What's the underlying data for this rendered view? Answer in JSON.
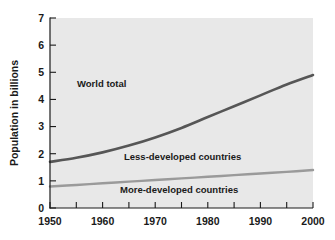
{
  "chart_data": {
    "type": "line",
    "title": "",
    "xlabel": "",
    "ylabel": "Population in billions",
    "xlim": [
      1950,
      2000
    ],
    "ylim": [
      0,
      7
    ],
    "grid": false,
    "legend_position": "inline-annotations",
    "x_ticks": [
      1950,
      1960,
      1970,
      1980,
      1990,
      2000
    ],
    "x_minor_ticks": [
      1955,
      1965,
      1975,
      1985,
      1995
    ],
    "y_ticks": [
      0,
      1,
      2,
      3,
      4,
      5,
      6,
      7
    ],
    "x": [
      1950,
      1955,
      1960,
      1965,
      1970,
      1975,
      1980,
      1985,
      1990,
      1995,
      2000
    ],
    "series": [
      {
        "name": "World total",
        "color": "#565656",
        "values": [
          1.7,
          1.85,
          2.05,
          2.3,
          2.6,
          2.95,
          3.35,
          3.75,
          4.15,
          4.55,
          4.9
        ]
      },
      {
        "name": "More-developed countries",
        "color": "#9a9a9a",
        "values": [
          0.79,
          0.85,
          0.91,
          0.97,
          1.03,
          1.09,
          1.15,
          1.21,
          1.27,
          1.33,
          1.4
        ]
      }
    ],
    "annotations": [
      {
        "text": "World total",
        "x": 1957,
        "y": 4.45
      },
      {
        "text": "Less-developed countries",
        "x": 1969,
        "y": 1.78
      },
      {
        "text": "More-developed countries",
        "x": 1969,
        "y": 0.56
      }
    ]
  },
  "axis": {
    "y_title": "Population in billions",
    "y_tick_labels": [
      "7",
      "6",
      "5",
      "4",
      "3",
      "2",
      "1",
      "0"
    ],
    "x_tick_labels": [
      "1950",
      "1960",
      "1970",
      "1980",
      "1990",
      "2000"
    ]
  },
  "labels": {
    "world_total": "World total",
    "less_developed": "Less-developed countries",
    "more_developed": "More-developed countries"
  },
  "colors": {
    "canvas": "#ffffff",
    "plot_background": "#e8e8e8",
    "axis": "#1a1a1a",
    "world_total_line": "#565656",
    "more_developed_line": "#9a9a9a"
  }
}
